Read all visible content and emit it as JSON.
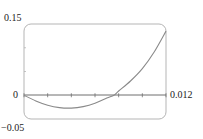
{
  "chart_data": {
    "type": "line",
    "title": "",
    "xlabel": "",
    "ylabel": "",
    "xlim": [
      0,
      0.012
    ],
    "ylim": [
      -0.05,
      0.15
    ],
    "grid": false,
    "legend": null,
    "x_ticks": [
      0,
      0.002,
      0.004,
      0.006,
      0.008,
      0.01,
      0.012
    ],
    "y_ticks": [
      -0.05,
      0,
      0.05,
      0.1,
      0.15
    ],
    "tick_labels": {
      "y_top": "0.15",
      "y_zero": "0",
      "y_bottom": "−0.05",
      "x_right": "0.012"
    },
    "series": [
      {
        "name": "curve",
        "color": "#8a8a8a",
        "x": [
          0,
          0.001,
          0.002,
          0.003,
          0.004,
          0.005,
          0.006,
          0.007,
          0.0076,
          0.008,
          0.009,
          0.01,
          0.011,
          0.012
        ],
        "y": [
          0,
          -0.012,
          -0.021,
          -0.026,
          -0.027,
          -0.024,
          -0.017,
          -0.006,
          0,
          0.009,
          0.03,
          0.056,
          0.091,
          0.135
        ]
      }
    ]
  },
  "colors": {
    "frame": "#b5b5b5",
    "axis": "#6e6e6e",
    "curve": "#8a8a8a",
    "text": "#222222"
  }
}
